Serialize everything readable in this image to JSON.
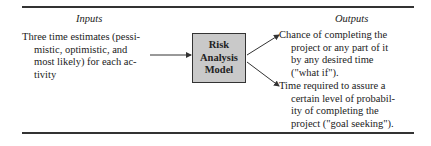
{
  "diagram": {
    "inputs": {
      "heading": "Inputs",
      "lines": [
        "Three time estimates (pessi-",
        "mistic, optimistic, and",
        "most likely) for each ac-",
        "tivity"
      ]
    },
    "model": {
      "lines": [
        "Risk",
        "Analysis",
        "Model"
      ],
      "fill_color": "#c9c9c9"
    },
    "outputs": {
      "heading": "Outputs",
      "items": [
        {
          "lines": [
            "Chance of completing the",
            "project or any part of it",
            "by any desired time",
            "(\"what if\")."
          ]
        },
        {
          "lines": [
            "Time required to assure a",
            "certain level of probabil-",
            "ity of completing the",
            "project (\"goal seeking\")."
          ]
        }
      ]
    }
  }
}
